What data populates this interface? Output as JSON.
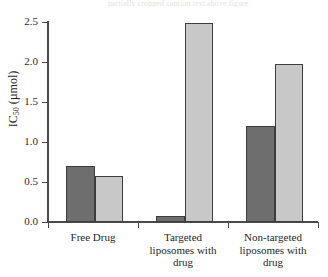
{
  "caption_remnant": "partially cropped caption text above figure",
  "chart_data": {
    "type": "bar",
    "title": "",
    "xlabel": "",
    "ylabel": "IC50 (µmol)",
    "ylabel_base": "IC",
    "ylabel_sub": "50",
    "ylabel_unit": " (µmol)",
    "categories": [
      "Free Drug",
      "Targeted liposomes with drug",
      "Non-targeted liposomes with drug"
    ],
    "category_lines": [
      [
        "Free Drug"
      ],
      [
        "Targeted",
        "liposomes with",
        "drug"
      ],
      [
        "Non-targeted",
        "liposomes with",
        "drug"
      ]
    ],
    "series": [
      {
        "name": "dark",
        "color": "#6e6e6e",
        "values": [
          0.7,
          0.07,
          1.2
        ]
      },
      {
        "name": "light",
        "color": "#c8c8c8",
        "values": [
          0.58,
          2.49,
          1.98
        ]
      }
    ],
    "ylim": [
      0.0,
      2.5
    ],
    "ytick_labels": [
      "0.0",
      "0.5",
      "1.0",
      "1.5",
      "2.0",
      "2.5"
    ],
    "ytick_values": [
      0.0,
      0.5,
      1.0,
      1.5,
      2.0,
      2.5
    ],
    "grid": false,
    "legend": "none",
    "bar_edge_color": "#3d3d3d",
    "axis_color": "#4a4a4a"
  }
}
